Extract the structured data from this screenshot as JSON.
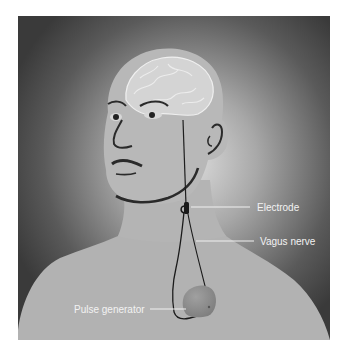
{
  "figure": {
    "colors": {
      "page_background": "#ffffff",
      "frame_dark": "#3d3d3d",
      "glow_light": "#d8d8d8",
      "skin": "#b4b4b4",
      "brain": "#d2d2d2",
      "outline": "#2a2a2a",
      "generator": "#8e8e8e",
      "label_text": "#f2f2f2",
      "leader_line": "#f0f0f0"
    },
    "labels": [
      {
        "id": "electrode",
        "text": "Electrode"
      },
      {
        "id": "vagus-nerve",
        "text": "Vagus nerve"
      },
      {
        "id": "pulse-generator",
        "text": "Pulse generator"
      }
    ]
  }
}
